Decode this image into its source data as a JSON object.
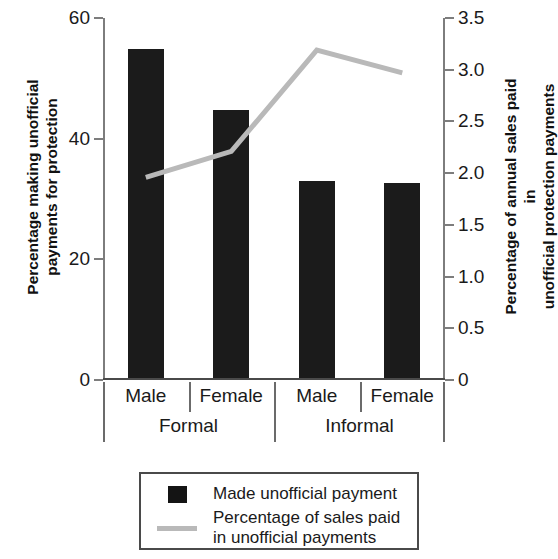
{
  "chart_data": {
    "type": "bar",
    "title": "",
    "subtitle": "",
    "categories": [
      "Male",
      "Female",
      "Male",
      "Female"
    ],
    "groups": [
      {
        "label": "Formal",
        "categories": [
          "Male",
          "Female"
        ]
      },
      {
        "label": "Informal",
        "categories": [
          "Male",
          "Female"
        ]
      }
    ],
    "series": [
      {
        "name": "Made unofficial payment",
        "type": "bar",
        "axis": "left",
        "color": "#1b1b1b",
        "values": [
          54.5,
          44.4,
          32.7,
          32.3
        ]
      },
      {
        "name": "Percentage of sales paid in unofficial payments",
        "type": "line",
        "axis": "right",
        "color": "#b9b9b9",
        "values": [
          1.96,
          2.21,
          3.19,
          2.97
        ]
      }
    ],
    "xlabel": "",
    "ylabel": "Percentage making unofficial\npayments for protection",
    "ylabel_right": "Percentage of annual sales paid in\nunofficial protection payments",
    "ylim": [
      0,
      60
    ],
    "ylim_right": [
      0,
      3.5
    ],
    "yticks": [
      "0",
      "20",
      "40",
      "60"
    ],
    "ytick_values": [
      0,
      20,
      40,
      60
    ],
    "yticks_right": [
      "0",
      "0.5",
      "1.0",
      "1.5",
      "2.0",
      "2.5",
      "3.0",
      "3.5"
    ],
    "ytick_values_right": [
      0,
      0.5,
      1.0,
      1.5,
      2.0,
      2.5,
      3.0,
      3.5
    ],
    "grid": false,
    "legend_position": "bottom"
  },
  "legend": {
    "items": [
      {
        "label": "Made unofficial payment",
        "marker": "square-swatch"
      },
      {
        "label": "Percentage of sales paid\nin unofficial payments",
        "marker": "line-swatch"
      }
    ]
  }
}
